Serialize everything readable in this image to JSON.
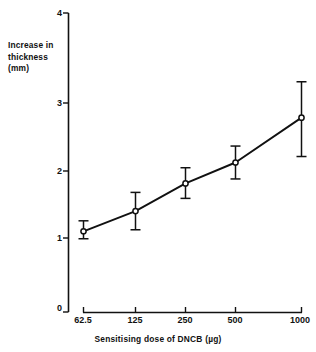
{
  "chart_data": {
    "type": "line",
    "title": "",
    "xlabel": "Sensitising dose of DNCB (µg)",
    "ylabel": "Increase in thickness (mm)",
    "ylabel_lines": [
      "Increase in",
      "thickness",
      "(mm)"
    ],
    "categories": [
      "62.5",
      "125",
      "250",
      "500",
      "1000"
    ],
    "x_numeric": [
      62.5,
      125,
      250,
      500,
      1000
    ],
    "x_scale": "log2-categorical",
    "values": [
      1.08,
      1.35,
      1.72,
      2.0,
      2.6
    ],
    "error_low": [
      0.98,
      1.1,
      1.52,
      1.78,
      2.08
    ],
    "error_high": [
      1.22,
      1.6,
      1.93,
      2.22,
      3.08
    ],
    "yticks": [
      0,
      1,
      2,
      3,
      4
    ],
    "ytick_labels": [
      "0",
      "1",
      "2",
      "3",
      "4"
    ],
    "ylim": [
      0,
      4
    ],
    "xtick_labels": [
      "62.5",
      "125",
      "250",
      "500",
      "1000"
    ],
    "grid": false,
    "legend": null,
    "marker": "open-circle",
    "line_color": "#111111",
    "marker_color": "#111111",
    "axis_color": "#111111",
    "background_color": "#ffffff"
  },
  "axes": {
    "y_title_lines": [
      "Increase in",
      "thickness",
      "(mm)"
    ],
    "x_title": "Sensitising dose of DNCB (µg)",
    "y_tick_0": "0",
    "y_tick_1": "1",
    "y_tick_2": "2",
    "y_tick_3": "3",
    "y_tick_4": "4",
    "x_tick_0": "62.5",
    "x_tick_1": "125",
    "x_tick_2": "250",
    "x_tick_3": "500",
    "x_tick_4": "1000"
  }
}
